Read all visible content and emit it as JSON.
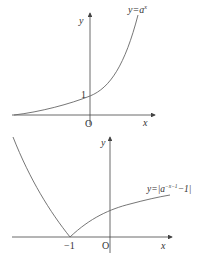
{
  "diagrams": [
    {
      "name": "exponential-graph",
      "curve_label": "y=a",
      "curve_label_sup": "x",
      "y_axis_label": "y",
      "x_axis_label": "x",
      "origin_label": "O",
      "y_intercept_label": "1"
    },
    {
      "name": "absolute-exponential-graph",
      "curve_label": "y=|a",
      "curve_label_sup": "−x−1",
      "curve_label_tail": "−1|",
      "y_axis_label": "y",
      "x_axis_label": "x",
      "origin_label": "O",
      "vertex_label": "−1"
    }
  ],
  "colors": {
    "axis": "#444444",
    "curve": "#666666",
    "text": "#333333"
  }
}
